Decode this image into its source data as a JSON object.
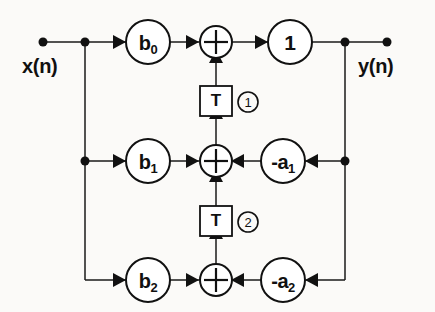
{
  "diagram": {
    "type": "signal-flow-graph",
    "background_color": "#fbfaf8",
    "line_color": "#111111",
    "io": {
      "input_label": "x(n)",
      "output_label": "y(n)"
    },
    "feedforward_coefficients": [
      {
        "id": "b0",
        "label": "b",
        "subscript": "0",
        "row": "top"
      },
      {
        "id": "b1",
        "label": "b",
        "subscript": "1",
        "row": "middle"
      },
      {
        "id": "b2",
        "label": "b",
        "subscript": "2",
        "row": "bottom"
      }
    ],
    "feedback_coefficients": [
      {
        "id": "a1",
        "label": "-a",
        "subscript": "1",
        "row": "middle"
      },
      {
        "id": "a2",
        "label": "-a",
        "subscript": "2",
        "row": "bottom"
      }
    ],
    "output_gain": {
      "id": "gain",
      "label": "1"
    },
    "delays": [
      {
        "id": "delay1",
        "label": "T",
        "marker": "1",
        "between": "top-adder and middle-adder"
      },
      {
        "id": "delay2",
        "label": "T",
        "marker": "2",
        "between": "middle-adder and bottom-adder"
      }
    ],
    "adders": [
      {
        "id": "adder-top",
        "symbol": "+",
        "row": "top"
      },
      {
        "id": "adder-middle",
        "symbol": "+",
        "row": "middle"
      },
      {
        "id": "adder-bottom",
        "symbol": "+",
        "row": "bottom"
      }
    ]
  }
}
